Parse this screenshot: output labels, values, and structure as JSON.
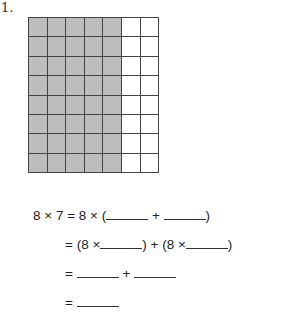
{
  "problem": {
    "number": "1.",
    "grid": {
      "rows": 8,
      "columns": 7,
      "shaded_columns": 5,
      "shade_color": "#bdbdbd",
      "line_color": "#444444"
    },
    "equations": {
      "line1": {
        "prefix": "8 × 7 = 8 × (",
        "plus": " + ",
        "suffix": ")"
      },
      "line2": {
        "prefix": "= (8 ×",
        "mid": ") + (8 ×",
        "suffix": ")"
      },
      "line3": {
        "prefix": "= ",
        "plus": " + "
      },
      "line4": {
        "prefix": "= "
      }
    }
  }
}
